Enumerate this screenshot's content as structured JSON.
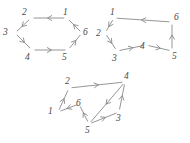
{
  "figure": {
    "title": "",
    "background_color": "#ffffff",
    "stroke_color": "#8a8a8a",
    "label_color": "#4a4a4a",
    "graphs": [
      {
        "name": "hexagon-cycle-left",
        "nodes": [
          {
            "id": "1",
            "label": "1",
            "x": 67,
            "y": 18,
            "label_x": 63,
            "label_y": 8
          },
          {
            "id": "2",
            "label": "2",
            "x": 31,
            "y": 18,
            "label_x": 22,
            "label_y": 8
          },
          {
            "id": "3",
            "label": "3",
            "x": 15,
            "y": 33,
            "label_x": 3,
            "label_y": 28
          },
          {
            "id": "4",
            "label": "4",
            "x": 32,
            "y": 50,
            "label_x": 25,
            "label_y": 53
          },
          {
            "id": "5",
            "label": "5",
            "x": 68,
            "y": 50,
            "label_x": 62,
            "label_y": 53
          },
          {
            "id": "6",
            "label": "6",
            "x": 82,
            "y": 33,
            "label_x": 83,
            "label_y": 28
          }
        ],
        "edges": [
          {
            "from": "1",
            "to": "2",
            "arrow_label": "1-to-2"
          },
          {
            "from": "2",
            "to": "3",
            "arrow_label": "2-to-3"
          },
          {
            "from": "3",
            "to": "4",
            "arrow_label": "3-to-4"
          },
          {
            "from": "4",
            "to": "5",
            "arrow_label": "4-to-5"
          },
          {
            "from": "5",
            "to": "6",
            "arrow_label": "5-to-6"
          },
          {
            "from": "6",
            "to": "1",
            "arrow_label": "6-to-1"
          }
        ]
      },
      {
        "name": "hexagon-cycle-right",
        "nodes": [
          {
            "id": "1",
            "label": "1",
            "x": 114,
            "y": 18,
            "label_x": 110,
            "label_y": 8
          },
          {
            "id": "2",
            "label": "2",
            "x": 105,
            "y": 33,
            "label_x": 96,
            "label_y": 29
          },
          {
            "id": "3",
            "label": "3",
            "x": 117,
            "y": 51,
            "label_x": 112,
            "label_y": 54
          },
          {
            "id": "4",
            "label": "4",
            "x": 146,
            "y": 45,
            "label_x": 140,
            "label_y": 42
          },
          {
            "id": "5",
            "label": "5",
            "x": 172,
            "y": 51,
            "label_x": 172,
            "label_y": 52
          },
          {
            "id": "6",
            "label": "6",
            "x": 172,
            "y": 22,
            "label_x": 174,
            "label_y": 13
          }
        ],
        "edges": [
          {
            "from": "1",
            "to": "2",
            "arrow_label": "1-to-2"
          },
          {
            "from": "2",
            "to": "3",
            "arrow_label": "2-to-3"
          },
          {
            "from": "3",
            "to": "4",
            "arrow_label": "3-to-4"
          },
          {
            "from": "4",
            "to": "5",
            "arrow_label": "4-to-5"
          },
          {
            "from": "5",
            "to": "6",
            "arrow_label": "5-to-6"
          },
          {
            "from": "6",
            "to": "1",
            "arrow_label": "6-to-1"
          }
        ]
      },
      {
        "name": "crossed-cycle-bottom",
        "nodes": [
          {
            "id": "1",
            "label": "1",
            "x": 58,
            "y": 112,
            "label_x": 48,
            "label_y": 107
          },
          {
            "id": "2",
            "label": "2",
            "x": 69,
            "y": 88,
            "label_x": 65,
            "label_y": 77
          },
          {
            "id": "3",
            "label": "3",
            "x": 119,
            "y": 112,
            "label_x": 116,
            "label_y": 114
          },
          {
            "id": "4",
            "label": "4",
            "x": 125,
            "y": 82,
            "label_x": 124,
            "label_y": 72
          },
          {
            "id": "5",
            "label": "5",
            "x": 89,
            "y": 124,
            "label_x": 85,
            "label_y": 126
          },
          {
            "id": "6",
            "label": "6",
            "x": 79,
            "y": 104,
            "label_x": 76,
            "label_y": 99
          }
        ],
        "edges": [
          {
            "from": "1",
            "to": "2",
            "arrow_label": "1-to-2"
          },
          {
            "from": "2",
            "to": "4",
            "arrow_label": "2-to-4"
          },
          {
            "from": "4",
            "to": "5",
            "arrow_label": "4-to-5"
          },
          {
            "from": "5",
            "to": "6",
            "arrow_label": "5-to-6"
          },
          {
            "from": "6",
            "to": "1",
            "arrow_label": "6-to-1"
          },
          {
            "from": "3",
            "to": "4",
            "arrow_label": "3-to-4"
          },
          {
            "from": "5",
            "to": "3",
            "arrow_label": "5-to-3"
          }
        ]
      }
    ]
  }
}
